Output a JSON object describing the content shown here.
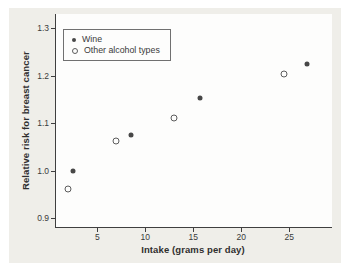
{
  "figure": {
    "panel_background": "#efeee9",
    "plot_background": "#fdfdfc",
    "axis_color": "#3f3f3f",
    "text_color": "#3a3a3a"
  },
  "chart_data": {
    "type": "scatter",
    "title": "",
    "xlabel": "Intake (grams per day)",
    "ylabel": "Relative risk for breast cancer",
    "xlim": [
      0.7,
      29.45
    ],
    "ylim": [
      0.8815,
      1.3295
    ],
    "x_tick_values": [
      5,
      10,
      15,
      20,
      25
    ],
    "x_tick_labels": [
      "5",
      "10",
      "15",
      "20",
      "25"
    ],
    "y_tick_values": [
      0.9,
      1.0,
      1.1,
      1.2,
      1.3
    ],
    "y_tick_labels": [
      "0.9",
      "1.0",
      "1.1",
      "1.2",
      "1.3"
    ],
    "grid": false,
    "legend_position": "top-left",
    "series": [
      {
        "name": "Wine",
        "marker": "filled-circle",
        "color": "#474747",
        "points": [
          [
            2.5,
            1.0
          ],
          [
            8.5,
            1.075
          ],
          [
            15.7,
            1.152
          ],
          [
            26.8,
            1.225
          ]
        ]
      },
      {
        "name": "Other alcohol types",
        "marker": "open-circle",
        "color": "#5c5c5c",
        "points": [
          [
            2.0,
            0.962
          ],
          [
            7.0,
            1.062
          ],
          [
            13.0,
            1.111
          ],
          [
            24.4,
            1.203
          ]
        ]
      }
    ]
  }
}
